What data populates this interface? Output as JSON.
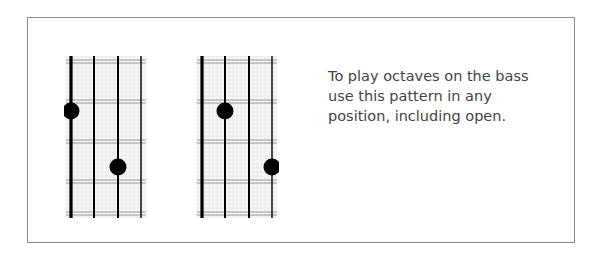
{
  "caption": {
    "lines": [
      "To play octaves on the bass",
      "use this pattern in any",
      "position, including open."
    ]
  },
  "diagrams": [
    {
      "name": "octave-pattern-left",
      "strings": 4,
      "dots": [
        {
          "string": 1,
          "fret": 2
        },
        {
          "string": 3,
          "fret": 4
        }
      ]
    },
    {
      "name": "octave-pattern-right",
      "strings": 4,
      "dots": [
        {
          "string": 2,
          "fret": 2
        },
        {
          "string": 4,
          "fret": 4
        }
      ]
    }
  ],
  "colors": {
    "border": "#8c8c8c",
    "string": "#000000",
    "fret": "#9a9a9a",
    "grid": "#e3e3e3",
    "dot": "#000000",
    "text": "#444444"
  }
}
